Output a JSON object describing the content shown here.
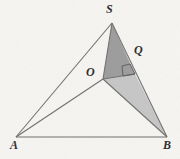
{
  "figure": {
    "background_color": "#f6f5f2",
    "stroke_color": "#6f6f6f",
    "label_color": "#2b2b2b",
    "dark_fill": "#9a9a9a",
    "light_fill": "#c4c4c4",
    "labels": [
      {
        "name": "A",
        "text": "A",
        "x": 10,
        "y": 139
      },
      {
        "name": "B",
        "text": "B",
        "x": 163,
        "y": 139
      },
      {
        "name": "S",
        "text": "S",
        "x": 106,
        "y": 3
      },
      {
        "name": "O",
        "text": "O",
        "x": 86,
        "y": 66
      },
      {
        "name": "Q",
        "text": "Q",
        "x": 134,
        "y": 44
      }
    ],
    "points": {
      "A": {
        "x": 16,
        "y": 137
      },
      "B": {
        "x": 167,
        "y": 137
      },
      "S": {
        "x": 112,
        "y": 23
      },
      "O": {
        "x": 103,
        "y": 79
      },
      "Q": {
        "x": 135,
        "y": 74
      }
    },
    "segments": [
      {
        "name": "segment-AB",
        "from": "A",
        "to": "B"
      },
      {
        "name": "segment-AS",
        "from": "A",
        "to": "S"
      },
      {
        "name": "segment-AO",
        "from": "A",
        "to": "O"
      },
      {
        "name": "segment-SB",
        "from": "S",
        "to": "B"
      },
      {
        "name": "segment-SO",
        "from": "S",
        "to": "O"
      },
      {
        "name": "segment-OQ",
        "from": "O",
        "to": "Q"
      },
      {
        "name": "segment-OB",
        "from": "O",
        "to": "B"
      }
    ],
    "shaded_regions": [
      {
        "name": "triangle-SOQ",
        "vertices": "S,O,Q",
        "shade": "dark"
      },
      {
        "name": "triangle-OQB",
        "vertices": "O,Q,B",
        "shade": "light"
      }
    ],
    "right_angle": {
      "name": "right-angle-at-Q",
      "at": "Q",
      "between": "OQ and SB"
    }
  }
}
